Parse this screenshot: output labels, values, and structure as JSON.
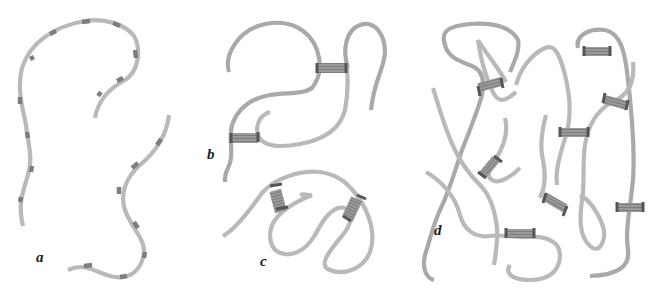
{
  "figure": {
    "panels": [
      {
        "id": "a",
        "label": "a",
        "crosslinks": 0
      },
      {
        "id": "b",
        "label": "b",
        "crosslinks": 2
      },
      {
        "id": "c",
        "label": "c",
        "crosslinks": 2
      },
      {
        "id": "d",
        "label": "d",
        "crosslinks": 9
      }
    ]
  },
  "colors": {
    "background": "#ffffff",
    "chain": "#b9b9b9",
    "segment_mark": "#7d7d7d",
    "crosslink": "#8a8a8a",
    "label": "#1a1a1a"
  }
}
